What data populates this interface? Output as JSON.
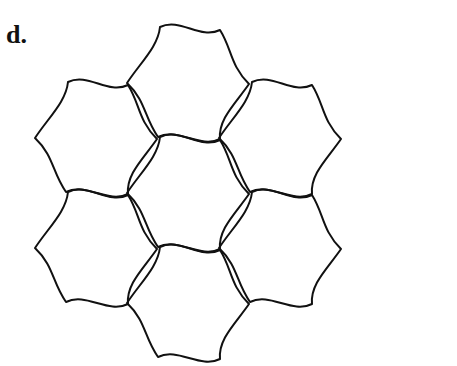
{
  "figure": {
    "panel_label": "d.",
    "stroke_color": "#111111",
    "background": "#ffffff",
    "cells": [
      {
        "name": "top",
        "cx": 188,
        "cy": 83
      },
      {
        "name": "upper-left",
        "cx": 96,
        "cy": 138
      },
      {
        "name": "upper-right",
        "cx": 280,
        "cy": 138
      },
      {
        "name": "center",
        "cx": 188,
        "cy": 193
      },
      {
        "name": "lower-left",
        "cx": 96,
        "cy": 248
      },
      {
        "name": "lower-right",
        "cx": 280,
        "cy": 248
      },
      {
        "name": "bottom",
        "cx": 188,
        "cy": 303
      }
    ]
  }
}
